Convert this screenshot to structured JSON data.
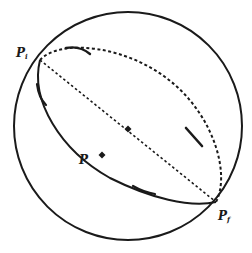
{
  "diagram": {
    "type": "sphere-path-diagram",
    "labels": {
      "initial_point": "P",
      "initial_sub": "i",
      "final_point": "P",
      "final_sub": "f",
      "midpoint": "P"
    },
    "colors": {
      "stroke": "#1a1a1a",
      "background": "#ffffff"
    },
    "elements": [
      "sphere outline",
      "dashed diameter from Pi to Pf",
      "dashed back great-circle arc (upper)",
      "solid front great-circle arc (lower)",
      "center marker on diameter",
      "point P on front arc",
      "direction arrows along arcs"
    ]
  }
}
